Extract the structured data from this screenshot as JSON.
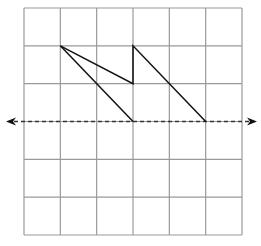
{
  "diagram": {
    "type": "grid-reflection",
    "grid": {
      "columns": 6,
      "rows": 6,
      "origin_px": [
        24,
        8
      ],
      "size_px": [
        218,
        227
      ],
      "line_color": "#9a9a9a"
    },
    "shape": {
      "vertices_grid": [
        [
          1,
          1
        ],
        [
          3,
          2
        ],
        [
          3,
          1
        ],
        [
          5,
          3
        ],
        [
          3,
          3
        ]
      ],
      "stroke_color": "#111111"
    },
    "mirror_line": {
      "row": 3,
      "style": "dashed",
      "color": "#333333",
      "arrows": [
        "left-arrow-icon",
        "right-arrow-icon"
      ]
    }
  }
}
